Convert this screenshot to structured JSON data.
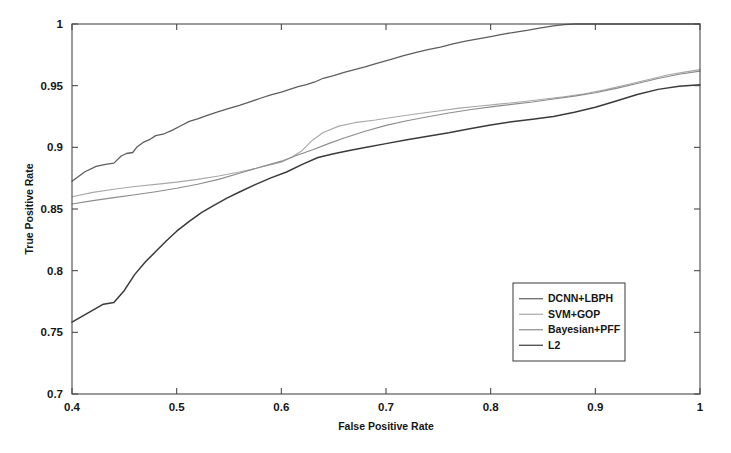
{
  "chart_data": {
    "type": "line",
    "title": "",
    "subtitle": "",
    "xlabel": "False Positive Rate",
    "ylabel": "True Positive Rate",
    "xlim": [
      0.4,
      1.0
    ],
    "ylim": [
      0.7,
      1.0
    ],
    "xticks": [
      0.4,
      0.5,
      0.6,
      0.7,
      0.8,
      0.9,
      1.0
    ],
    "xtick_labels": [
      "0.4",
      "0.5",
      "0.6",
      "0.7",
      "0.8",
      "0.9",
      "1"
    ],
    "yticks": [
      0.7,
      0.75,
      0.8,
      0.85,
      0.9,
      0.95,
      1.0
    ],
    "ytick_labels": [
      "0.7",
      "0.75",
      "0.8",
      "0.85",
      "0.9",
      "0.95",
      "1"
    ],
    "grid": false,
    "legend_position": "lower right",
    "series": [
      {
        "name": "DCNN+LBPH",
        "color": "#5e5e5e",
        "width": 1.3,
        "x": [
          0.4,
          0.412,
          0.423,
          0.432,
          0.44,
          0.447,
          0.452,
          0.458,
          0.462,
          0.468,
          0.474,
          0.48,
          0.488,
          0.496,
          0.504,
          0.512,
          0.52,
          0.53,
          0.54,
          0.55,
          0.56,
          0.57,
          0.58,
          0.59,
          0.6,
          0.608,
          0.616,
          0.624,
          0.632,
          0.64,
          0.65,
          0.66,
          0.67,
          0.68,
          0.692,
          0.704,
          0.716,
          0.728,
          0.74,
          0.752,
          0.764,
          0.776,
          0.788,
          0.8,
          0.812,
          0.824,
          0.836,
          0.848,
          0.86,
          0.87,
          0.88,
          0.9,
          0.94,
          1.0
        ],
        "y": [
          0.8725,
          0.88,
          0.8845,
          0.8862,
          0.8872,
          0.893,
          0.895,
          0.8958,
          0.9002,
          0.904,
          0.9062,
          0.9095,
          0.911,
          0.914,
          0.9175,
          0.921,
          0.923,
          0.9262,
          0.929,
          0.9315,
          0.934,
          0.9368,
          0.9398,
          0.9425,
          0.9448,
          0.947,
          0.9492,
          0.9508,
          0.953,
          0.956,
          0.9582,
          0.9608,
          0.963,
          0.9652,
          0.9682,
          0.9712,
          0.9742,
          0.9768,
          0.9792,
          0.9812,
          0.9838,
          0.9862,
          0.988,
          0.9898,
          0.9918,
          0.9935,
          0.995,
          0.9968,
          0.9985,
          0.9995,
          1.0,
          1.0,
          1.0,
          1.0
        ]
      },
      {
        "name": "SVM+GOP",
        "color": "#a8a8a8",
        "width": 1.1,
        "x": [
          0.4,
          0.42,
          0.44,
          0.46,
          0.48,
          0.5,
          0.52,
          0.54,
          0.56,
          0.58,
          0.6,
          0.61,
          0.62,
          0.63,
          0.64,
          0.655,
          0.67,
          0.69,
          0.71,
          0.73,
          0.75,
          0.77,
          0.79,
          0.81,
          0.83,
          0.85,
          0.87,
          0.89,
          0.91,
          0.93,
          0.95,
          0.97,
          0.985,
          1.0
        ],
        "y": [
          0.86,
          0.8635,
          0.866,
          0.8682,
          0.87,
          0.8718,
          0.874,
          0.8768,
          0.88,
          0.8838,
          0.888,
          0.892,
          0.8975,
          0.906,
          0.912,
          0.9172,
          0.92,
          0.9222,
          0.9248,
          0.9272,
          0.9295,
          0.9318,
          0.9335,
          0.9352,
          0.937,
          0.939,
          0.941,
          0.9435,
          0.9468,
          0.9508,
          0.9548,
          0.9588,
          0.961,
          0.963
        ]
      },
      {
        "name": "Bayesian+PFF",
        "color": "#8c8c8c",
        "width": 1.1,
        "x": [
          0.4,
          0.42,
          0.44,
          0.46,
          0.48,
          0.5,
          0.52,
          0.54,
          0.56,
          0.58,
          0.6,
          0.615,
          0.63,
          0.645,
          0.66,
          0.68,
          0.7,
          0.72,
          0.74,
          0.76,
          0.78,
          0.8,
          0.82,
          0.84,
          0.86,
          0.88,
          0.9,
          0.92,
          0.94,
          0.96,
          0.98,
          1.0
        ],
        "y": [
          0.854,
          0.8568,
          0.8592,
          0.8615,
          0.864,
          0.8668,
          0.87,
          0.874,
          0.879,
          0.884,
          0.8888,
          0.8935,
          0.898,
          0.903,
          0.9075,
          0.913,
          0.9178,
          0.9215,
          0.9248,
          0.9278,
          0.9305,
          0.9328,
          0.9348,
          0.9368,
          0.9392,
          0.9415,
          0.9442,
          0.9478,
          0.9518,
          0.9558,
          0.9592,
          0.9618
        ]
      },
      {
        "name": "L2",
        "color": "#3a3a3a",
        "width": 1.5,
        "x": [
          0.4,
          0.415,
          0.43,
          0.44,
          0.45,
          0.46,
          0.47,
          0.48,
          0.49,
          0.5,
          0.512,
          0.524,
          0.536,
          0.548,
          0.56,
          0.575,
          0.59,
          0.605,
          0.62,
          0.635,
          0.65,
          0.665,
          0.68,
          0.7,
          0.72,
          0.74,
          0.76,
          0.78,
          0.8,
          0.82,
          0.84,
          0.86,
          0.88,
          0.9,
          0.92,
          0.94,
          0.96,
          0.98,
          1.0
        ],
        "y": [
          0.7582,
          0.7655,
          0.7728,
          0.7742,
          0.784,
          0.797,
          0.807,
          0.8155,
          0.824,
          0.832,
          0.84,
          0.8472,
          0.8532,
          0.8588,
          0.8638,
          0.8698,
          0.8752,
          0.88,
          0.8862,
          0.8918,
          0.8948,
          0.8975,
          0.8998,
          0.903,
          0.9062,
          0.909,
          0.9118,
          0.915,
          0.9182,
          0.9208,
          0.9228,
          0.925,
          0.9285,
          0.9325,
          0.9375,
          0.9428,
          0.947,
          0.9495,
          0.9508
        ]
      }
    ]
  },
  "legend": {
    "entries": [
      {
        "label": "DCNN+LBPH"
      },
      {
        "label": "SVM+GOP"
      },
      {
        "label": "Bayesian+PFF"
      },
      {
        "label": "L2"
      }
    ]
  }
}
